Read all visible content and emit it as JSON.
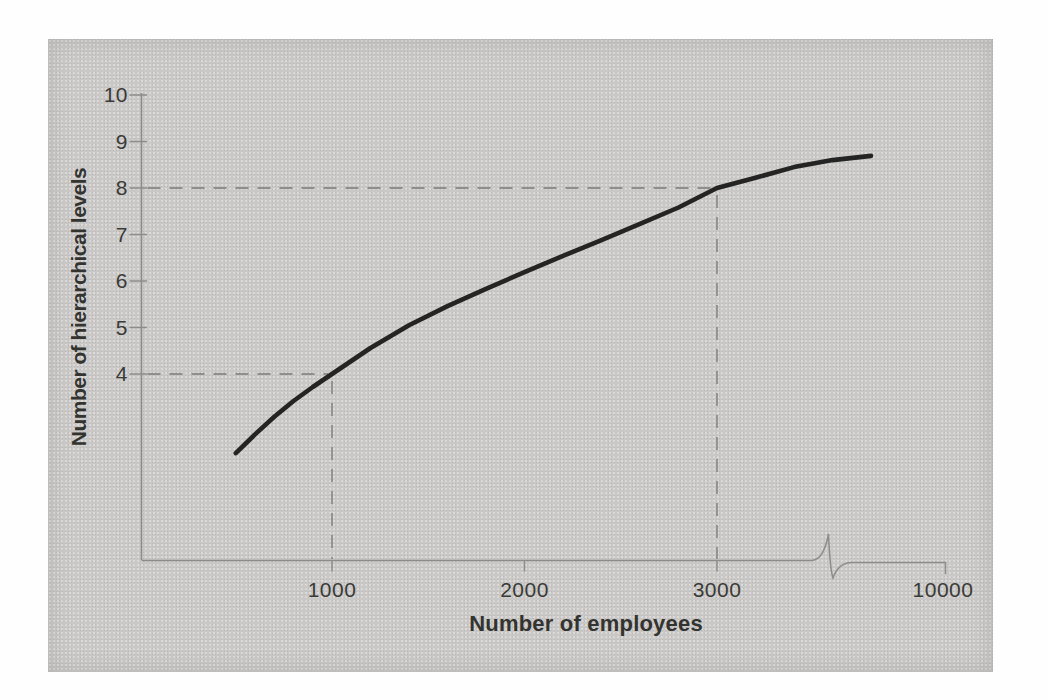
{
  "chart_data": {
    "type": "line",
    "title": "",
    "xlabel": "Number of employees",
    "ylabel": "Number of hierarchical levels",
    "x_ticks": [
      1000,
      2000,
      3000,
      10000
    ],
    "x_tick_labels": [
      "1000",
      "2000",
      "3000",
      "10000"
    ],
    "y_ticks": [
      10,
      9,
      8,
      7,
      6,
      5,
      4
    ],
    "y_tick_labels": [
      "10",
      "9",
      "8",
      "7",
      "6",
      "5",
      "4"
    ],
    "ylim": [
      0,
      10
    ],
    "x_axis_break": {
      "between": [
        3000,
        10000
      ]
    },
    "grid": false,
    "legend": false,
    "series": [
      {
        "name": "hierarchical-levels-curve",
        "x": [
          500,
          600,
          700,
          800,
          900,
          1000,
          1200,
          1400,
          1600,
          1800,
          2000,
          2200,
          2400,
          2600,
          2800,
          3000,
          3200,
          3400,
          3600,
          3800
        ],
        "y": [
          2.3,
          2.7,
          3.08,
          3.42,
          3.72,
          4.0,
          4.56,
          5.05,
          5.46,
          5.83,
          6.19,
          6.54,
          6.88,
          7.23,
          7.58,
          8.0,
          8.22,
          8.45,
          8.6,
          8.69
        ]
      }
    ],
    "reference_points": [
      {
        "x": 1000,
        "y": 4
      },
      {
        "x": 3000,
        "y": 8
      }
    ]
  },
  "colors": {
    "panel_background": "#c9c8c6",
    "page_background": "#fefefe",
    "curve": "#242424",
    "axis": "#8c8c8a",
    "dashed_reference": "#8e8e8c",
    "text": "#3a3a37"
  }
}
